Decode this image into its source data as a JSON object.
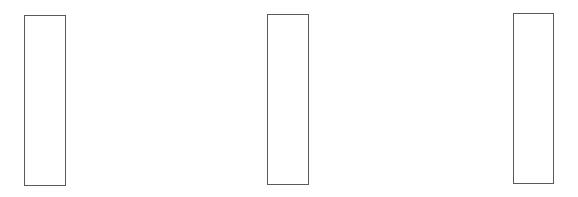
{
  "diagram": {
    "background": "#ffffff",
    "stroke_color": "#5a5a5a",
    "boxes": [
      {
        "name": "left-box",
        "x": 24,
        "y": 15,
        "width": 42,
        "height": 171,
        "label": ""
      },
      {
        "name": "middle-box",
        "x": 267,
        "y": 14,
        "width": 42,
        "height": 171,
        "label": ""
      },
      {
        "name": "right-box",
        "x": 513,
        "y": 13,
        "width": 41,
        "height": 171,
        "label": ""
      }
    ]
  }
}
